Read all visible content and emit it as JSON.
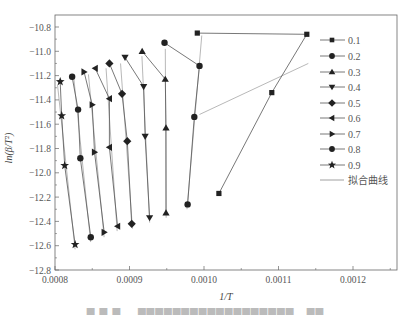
{
  "chart_data": {
    "type": "scatter",
    "title": "",
    "xlabel": "1/T",
    "ylabel": "ln(β/T²)",
    "xlim": [
      0.0008,
      0.00126
    ],
    "ylim": [
      -12.8,
      -10.7
    ],
    "x_ticks": [
      "0.0008",
      "0.0009",
      "0.0010",
      "0.0011",
      "0.0012"
    ],
    "y_ticks": [
      "-10.8",
      "-11.0",
      "-11.2",
      "-11.4",
      "-11.6",
      "-11.8",
      "-12.0",
      "-12.2",
      "-12.4",
      "-12.6",
      "-12.8"
    ],
    "grid": false,
    "legend_position": "right-inside",
    "series": [
      {
        "name": "0.1",
        "marker": "square",
        "x": [
          0.000991,
          0.001138,
          0.001091,
          0.00102
        ],
        "y": [
          -10.85,
          -10.86,
          -11.34,
          -12.17
        ]
      },
      {
        "name": "0.2",
        "marker": "circle",
        "x": [
          0.000947,
          0.000994,
          0.000987,
          0.000978
        ],
        "y": [
          -10.93,
          -11.12,
          -11.54,
          -12.26
        ]
      },
      {
        "name": "0.3",
        "marker": "triangle-up",
        "x": [
          0.000917,
          0.000948,
          0.000949,
          0.000949
        ],
        "y": [
          -11.0,
          -11.23,
          -11.63,
          -12.33
        ]
      },
      {
        "name": "0.4",
        "marker": "triangle-down",
        "x": [
          0.000894,
          0.000919,
          0.000921,
          0.000927
        ],
        "y": [
          -11.05,
          -11.29,
          -11.7,
          -12.37
        ]
      },
      {
        "name": "0.5",
        "marker": "diamond",
        "x": [
          0.000873,
          0.00089,
          0.000897,
          0.000903
        ],
        "y": [
          -11.1,
          -11.35,
          -11.74,
          -12.42
        ]
      },
      {
        "name": "0.6",
        "marker": "triangle-left",
        "x": [
          0.000854,
          0.000873,
          0.000873,
          0.000884
        ],
        "y": [
          -11.14,
          -11.39,
          -11.79,
          -12.44
        ]
      },
      {
        "name": "0.7",
        "marker": "triangle-right",
        "x": [
          0.000839,
          0.00085,
          0.000853,
          0.000866
        ],
        "y": [
          -11.17,
          -11.44,
          -11.83,
          -12.49
        ]
      },
      {
        "name": "0.8",
        "marker": "octagon",
        "x": [
          0.000823,
          0.000831,
          0.000834,
          0.000848
        ],
        "y": [
          -11.21,
          -11.48,
          -11.88,
          -12.53
        ]
      },
      {
        "name": "0.9",
        "marker": "star",
        "x": [
          0.000807,
          0.000809,
          0.000813,
          0.000827
        ],
        "y": [
          -11.25,
          -11.53,
          -11.94,
          -12.59
        ]
      }
    ],
    "fit_lines_label": "拟合曲线"
  },
  "legend": {
    "items": [
      {
        "label": "0.1",
        "marker": "square"
      },
      {
        "label": "0.2",
        "marker": "circle"
      },
      {
        "label": "0.3",
        "marker": "triangle-up"
      },
      {
        "label": "0.4",
        "marker": "triangle-down"
      },
      {
        "label": "0.5",
        "marker": "diamond"
      },
      {
        "label": "0.6",
        "marker": "triangle-left"
      },
      {
        "label": "0.7",
        "marker": "triangle-right"
      },
      {
        "label": "0.8",
        "marker": "octagon"
      },
      {
        "label": "0.9",
        "marker": "star"
      },
      {
        "label": "拟合曲线",
        "marker": "line"
      }
    ]
  },
  "axes": {
    "xlabel": "1/T",
    "ylabel": "ln(β/T²)"
  },
  "colors": {
    "marker": "#222222",
    "line": "#555555",
    "fit_line": "#888888",
    "axis": "#666666"
  }
}
